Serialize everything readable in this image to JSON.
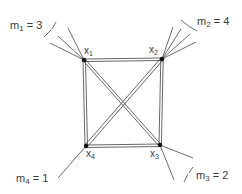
{
  "diagram": {
    "type": "complete-graph-K4",
    "vertices": [
      {
        "id": "x1",
        "label": "x",
        "sub": "1",
        "pos": [
          84,
          60
        ]
      },
      {
        "id": "x2",
        "label": "x",
        "sub": "2",
        "pos": [
          162,
          59
        ]
      },
      {
        "id": "x3",
        "label": "x",
        "sub": "3",
        "pos": [
          160,
          145
        ]
      },
      {
        "id": "x4",
        "label": "x",
        "sub": "4",
        "pos": [
          86,
          146
        ]
      }
    ],
    "edges": [
      [
        "x1",
        "x2"
      ],
      [
        "x2",
        "x3"
      ],
      [
        "x3",
        "x4"
      ],
      [
        "x4",
        "x1"
      ],
      [
        "x1",
        "x3"
      ],
      [
        "x2",
        "x4"
      ]
    ],
    "multiplicities": [
      {
        "vertex": "x1",
        "label": "m",
        "sub": "1",
        "value": "= 3"
      },
      {
        "vertex": "x2",
        "label": "m",
        "sub": "2",
        "value": "= 4"
      },
      {
        "vertex": "x3",
        "label": "m",
        "sub": "3",
        "value": "= 2"
      },
      {
        "vertex": "x4",
        "label": "m",
        "sub": "4",
        "value": "= 1"
      }
    ]
  }
}
